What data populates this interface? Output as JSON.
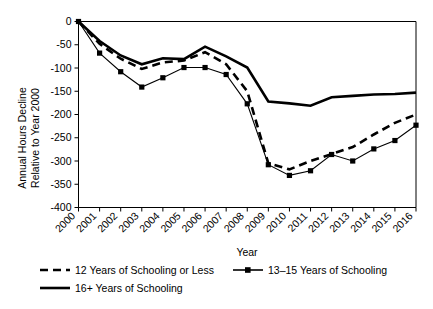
{
  "chart_data": {
    "type": "line",
    "title": "",
    "xlabel": "Year",
    "ylabel": "Annual Hours Decline Relative to Year 2000",
    "ylabel_line1": "Annual Hours Decline",
    "ylabel_line2": "Relative to Year 2000",
    "categories": [
      "2000",
      "2001",
      "2002",
      "2003",
      "2004",
      "2005",
      "2006",
      "2007",
      "2008",
      "2009",
      "2010",
      "2011",
      "2012",
      "2013",
      "2014",
      "2015",
      "2016"
    ],
    "x": [
      2000,
      2001,
      2002,
      2003,
      2004,
      2005,
      2006,
      2007,
      2008,
      2009,
      2010,
      2011,
      2012,
      2013,
      2014,
      2015,
      2016
    ],
    "ylim": [
      -400,
      0
    ],
    "yticks": [
      0,
      -50,
      -100,
      -150,
      -200,
      -250,
      -300,
      -350,
      -400
    ],
    "ytick_labels": [
      "0",
      "-50",
      "-100",
      "-150",
      "-200",
      "-250",
      "-300",
      "-350",
      "-400"
    ],
    "grid": false,
    "legend_position": "below",
    "series": [
      {
        "name": "12 Years of Schooling or Less",
        "style": "dashed",
        "marker": "none",
        "values": [
          0,
          -48,
          -80,
          -102,
          -88,
          -84,
          -66,
          -92,
          -150,
          -305,
          -318,
          -300,
          -285,
          -270,
          -243,
          -218,
          -200
        ]
      },
      {
        "name": "13–15 Years of Schooling",
        "style": "thin-solid",
        "marker": "square",
        "values": [
          0,
          -68,
          -108,
          -141,
          -121,
          -99,
          -99,
          -114,
          -177,
          -308,
          -331,
          -321,
          -286,
          -300,
          -274,
          -256,
          -223
        ]
      },
      {
        "name": "16+ Years of Schooling",
        "style": "thick-solid",
        "marker": "none",
        "values": [
          0,
          -42,
          -73,
          -92,
          -79,
          -81,
          -54,
          -75,
          -99,
          -172,
          -176,
          -181,
          -163,
          -160,
          -157,
          -156,
          -153
        ]
      }
    ]
  },
  "legend": {
    "items": [
      {
        "label": "12 Years of Schooling or Less",
        "style": "dashed"
      },
      {
        "label": "13–15 Years of Schooling",
        "style": "thin-solid-marker"
      },
      {
        "label": "16+ Years of Schooling",
        "style": "thick-solid"
      }
    ]
  }
}
